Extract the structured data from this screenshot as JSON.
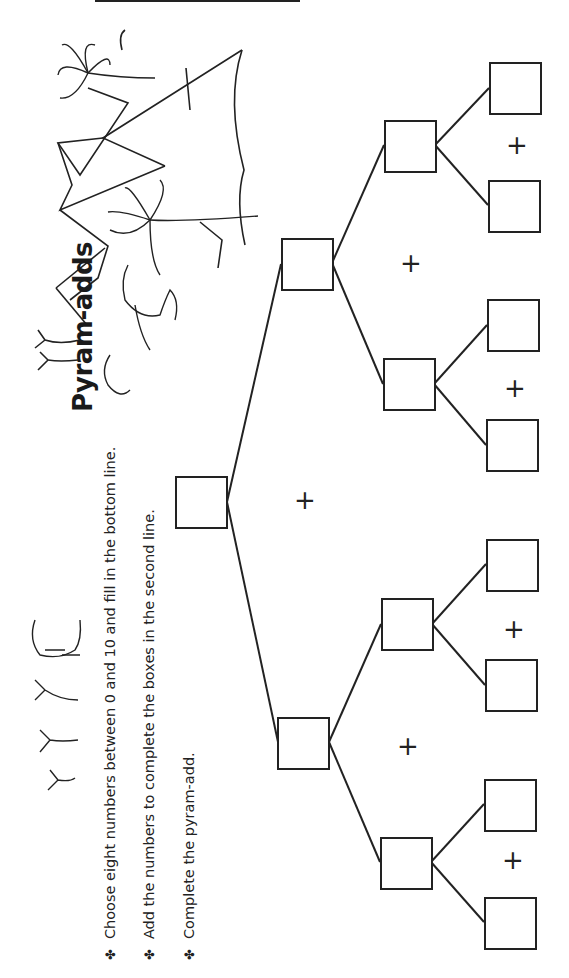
{
  "header": {
    "name_label": "Name"
  },
  "worksheet": {
    "title": "Pyram-adds",
    "orientation": "rotated-90-ccw",
    "instructions": [
      {
        "bullet": "✤",
        "text": "Choose eight numbers between 0 and 10 and fill in the bottom line."
      },
      {
        "bullet": "✤",
        "text": "Add the numbers to complete the boxes in the second line."
      },
      {
        "bullet": "✤",
        "text": "Complete the pyram-add."
      }
    ],
    "operator_symbol": "+",
    "pyramid": {
      "top": {
        "value": ""
      },
      "level2": [
        {
          "value": ""
        },
        {
          "value": ""
        }
      ],
      "level3": [
        {
          "value": ""
        },
        {
          "value": ""
        },
        {
          "value": ""
        },
        {
          "value": ""
        }
      ],
      "bottom": [
        {
          "value": ""
        },
        {
          "value": ""
        },
        {
          "value": ""
        },
        {
          "value": ""
        },
        {
          "value": ""
        },
        {
          "value": ""
        },
        {
          "value": ""
        },
        {
          "value": ""
        }
      ]
    },
    "illustrations": [
      "pyramids",
      "palm-trees",
      "camels"
    ]
  },
  "colors": {
    "ink": "#222222",
    "paper": "#ffffff"
  }
}
